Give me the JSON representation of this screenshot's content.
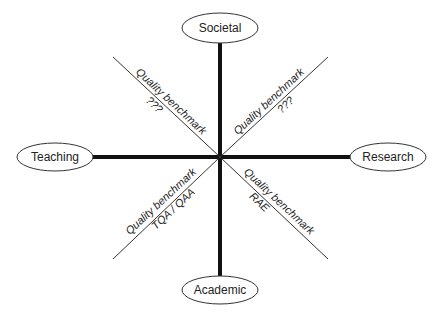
{
  "diagram": {
    "title": "",
    "center": {
      "x": 220,
      "y": 157
    },
    "colors": {
      "line": "#111111",
      "ellipse_stroke": "#333333",
      "text": "#222222",
      "background": "#ffffff"
    },
    "nodes": [
      {
        "id": "societal",
        "label": "Societal",
        "cx": 220,
        "cy": 28
      },
      {
        "id": "academic",
        "label": "Academic",
        "cx": 220,
        "cy": 290
      },
      {
        "id": "teaching",
        "label": "Teaching",
        "cx": 55,
        "cy": 157
      },
      {
        "id": "research",
        "label": "Research",
        "cx": 388,
        "cy": 157
      }
    ],
    "benchmarks": [
      {
        "id": "top-left",
        "title": "Quality benchmark",
        "value": "???"
      },
      {
        "id": "top-right",
        "title": "Quality benchmark",
        "value": "???"
      },
      {
        "id": "bottom-left",
        "title": "Quality benchmark",
        "value": "TQA / QAA"
      },
      {
        "id": "bottom-right",
        "title": "Quality benchmark",
        "value": "RAE"
      }
    ]
  }
}
